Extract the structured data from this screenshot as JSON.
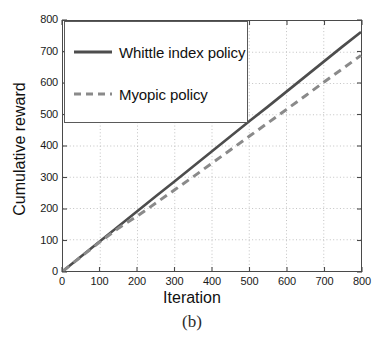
{
  "figure": {
    "caption": "(b)",
    "background_color": "#ffffff"
  },
  "chart_data": {
    "type": "line",
    "title": "",
    "xlabel": "Iteration",
    "ylabel": "Cumulative reward",
    "xlim": [
      0,
      800
    ],
    "ylim": [
      0,
      800
    ],
    "xticks": [
      0,
      100,
      200,
      300,
      400,
      500,
      600,
      700,
      800
    ],
    "yticks": [
      0,
      100,
      200,
      300,
      400,
      500,
      600,
      700,
      800
    ],
    "xtick_labels": [
      "0",
      "100",
      "200",
      "300",
      "400",
      "500",
      "600",
      "700",
      "800"
    ],
    "ytick_labels": [
      "0",
      "100",
      "200",
      "300",
      "400",
      "500",
      "600",
      "700",
      "800"
    ],
    "grid": true,
    "grid_style": "dotted",
    "grid_color": "#bbbbbb",
    "legend_position": "upper left",
    "x": [
      0,
      50,
      100,
      150,
      200,
      250,
      300,
      350,
      400,
      450,
      500,
      550,
      600,
      650,
      700,
      750,
      800
    ],
    "series": [
      {
        "name": "Whittle index policy",
        "style": "solid",
        "color": "#4d4d4d",
        "line_width": 2.6,
        "values": [
          0,
          48,
          96,
          144,
          192,
          240,
          287,
          335,
          383,
          431,
          479,
          526,
          574,
          622,
          670,
          718,
          765
        ]
      },
      {
        "name": "Myopic policy",
        "style": "dashed",
        "color": "#8a8a8a",
        "line_width": 3.0,
        "values": [
          0,
          47,
          94,
          138,
          176,
          218,
          260,
          302,
          345,
          388,
          431,
          474,
          517,
          560,
          604,
          647,
          690
        ]
      }
    ]
  },
  "legend": {
    "items": [
      {
        "label": "Whittle index policy",
        "style": "solid",
        "color": "#4d4d4d"
      },
      {
        "label": "Myopic policy",
        "style": "dashed",
        "color": "#8a8a8a"
      }
    ]
  }
}
